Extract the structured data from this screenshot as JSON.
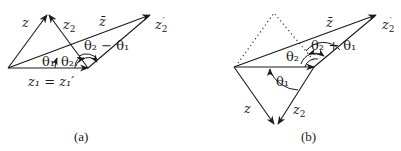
{
  "figure": {
    "panels": [
      {
        "id": "a",
        "caption": "(a)",
        "labels": {
          "z": "z",
          "z2": "z",
          "z2_sub": "2",
          "zbar": "z̄",
          "z2prime": "z",
          "z2prime_sub": "2",
          "z2prime_mark": "′",
          "angle_diff": "θ₂ − θ₁",
          "theta1": "θ₁",
          "theta2": "θ₂",
          "z1_eq": "z₁ = z₁′"
        }
      },
      {
        "id": "b",
        "caption": "(b)",
        "labels": {
          "z": "z",
          "z2": "z",
          "z2_sub": "2",
          "zbar": "z̄",
          "z2prime": "z",
          "z2prime_sub": "2",
          "z2prime_mark": "′",
          "angle_sum": "θ₂ + θ₁",
          "theta1": "θ₁",
          "theta2": "θ₂"
        }
      }
    ]
  }
}
